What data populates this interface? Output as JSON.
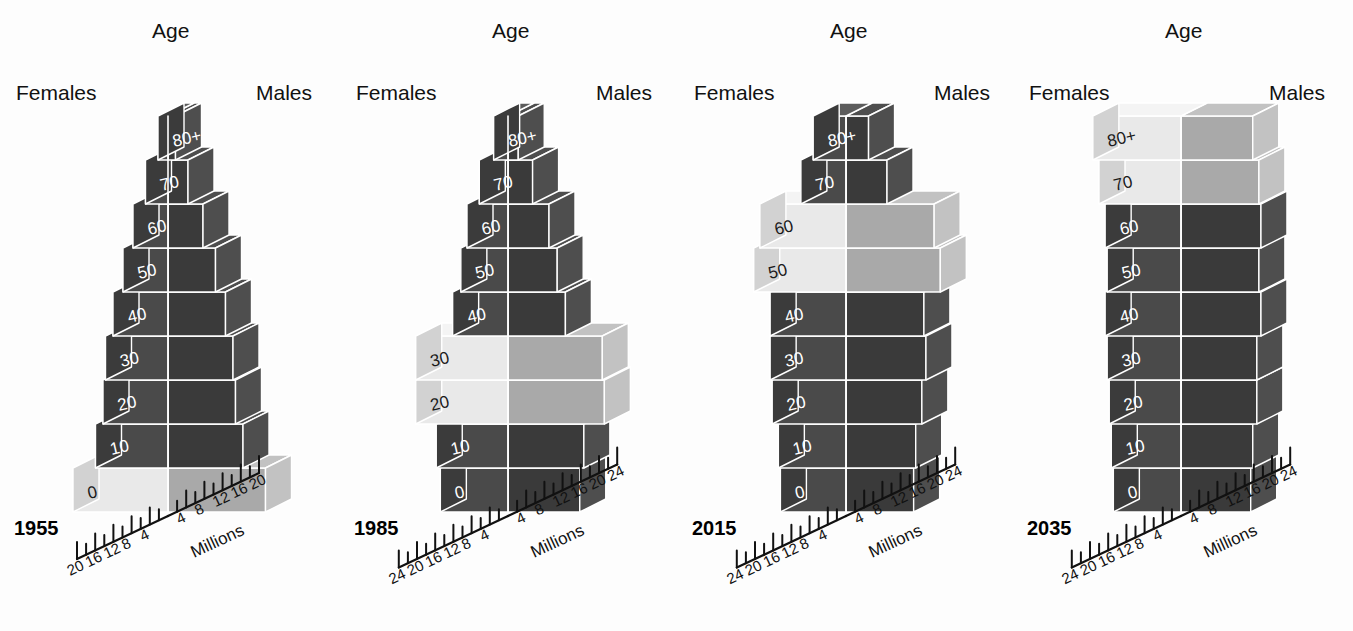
{
  "figure": {
    "background": "#fdfdfd",
    "panel_count": 4
  },
  "labels": {
    "age": "Age",
    "females": "Females",
    "males": "Males",
    "axis_title": "Millions"
  },
  "colors": {
    "dark_front": "#4a4a4a",
    "dark_top": "#5c5c5c",
    "dark_side": "#3b3b3b",
    "dark_male_front": "#3a3a3a",
    "dark_male_top": "#4e4e4e",
    "light_front": "#e9e9e9",
    "light_top": "#f4f4f4",
    "light_side": "#d2d2d2",
    "light_male_front": "#a9a9a9",
    "light_male_top": "#c2c2c2",
    "edge": "#ffffff",
    "text_on_dark": "#ffffff",
    "text_on_light": "#1b1b1b",
    "axis": "#111111"
  },
  "chart_data": {
    "type": "bar",
    "title": "",
    "subtitle": "",
    "xlabel": "Millions",
    "ylabel": "Age",
    "grid": false,
    "legend_position": "top",
    "age_groups": [
      "0",
      "10",
      "20",
      "30",
      "40",
      "50",
      "60",
      "70",
      "80+"
    ],
    "panels": [
      {
        "year": "1955",
        "xlim": [
          0,
          20
        ],
        "ticks_major": [
          20,
          16,
          12,
          8,
          4,
          4,
          8,
          12,
          16,
          20
        ],
        "tick_labels_left": [
          "20",
          "16",
          "12",
          "8",
          "4"
        ],
        "tick_labels_right": [
          "4",
          "8",
          "12",
          "16",
          "20"
        ],
        "tick_step_minor": 2,
        "series": [
          {
            "name": "Females",
            "values": [
              19.0,
              14.5,
              13.0,
              12.5,
              11.0,
              9.0,
              7.0,
              4.5,
              2.0
            ]
          },
          {
            "name": "Males",
            "values": [
              19.5,
              15.0,
              13.5,
              13.0,
              11.5,
              9.5,
              7.0,
              4.0,
              1.5
            ]
          }
        ],
        "highlighted": [
          "0"
        ]
      },
      {
        "year": "1985",
        "xlim": [
          0,
          24
        ],
        "ticks_major": [
          24,
          20,
          16,
          12,
          8,
          4,
          4,
          8,
          12,
          16,
          20,
          24
        ],
        "tick_labels_left": [
          "24",
          "20",
          "16",
          "12",
          "8",
          "4"
        ],
        "tick_labels_right": [
          "4",
          "8",
          "12",
          "16",
          "20",
          "24"
        ],
        "tick_step_minor": 2,
        "series": [
          {
            "name": "Females",
            "values": [
              16.5,
              17.5,
              22.5,
              22.5,
              13.5,
              11.5,
              10.0,
              7.0,
              3.5
            ]
          },
          {
            "name": "Males",
            "values": [
              17.5,
              18.5,
              23.5,
              23.0,
              14.0,
              12.0,
              10.0,
              6.0,
              2.5
            ]
          }
        ],
        "highlighted": [
          "20",
          "30"
        ]
      },
      {
        "year": "2015",
        "xlim": [
          0,
          24
        ],
        "ticks_major": [
          24,
          20,
          16,
          12,
          8,
          4,
          4,
          8,
          12,
          16,
          20,
          24
        ],
        "tick_labels_left": [
          "24",
          "20",
          "16",
          "12",
          "8",
          "4"
        ],
        "tick_labels_right": [
          "4",
          "8",
          "12",
          "16",
          "20",
          "24"
        ],
        "tick_step_minor": 2,
        "series": [
          {
            "name": "Females",
            "values": [
              16.0,
              16.5,
              18.0,
              18.5,
              18.5,
              22.5,
              21.0,
              11.0,
              8.0
            ]
          },
          {
            "name": "Males",
            "values": [
              16.5,
              17.0,
              18.5,
              19.5,
              19.0,
              23.0,
              21.5,
              10.0,
              5.5
            ]
          }
        ],
        "highlighted": [
          "50",
          "60"
        ]
      },
      {
        "year": "2035",
        "xlim": [
          0,
          24
        ],
        "ticks_major": [
          24,
          20,
          16,
          12,
          8,
          4,
          4,
          8,
          12,
          16,
          20,
          24
        ],
        "tick_labels_left": [
          "24",
          "20",
          "16",
          "12",
          "8",
          "4"
        ],
        "tick_labels_right": [
          "4",
          "8",
          "12",
          "16",
          "20",
          "24"
        ],
        "tick_step_minor": 2,
        "series": [
          {
            "name": "Females",
            "values": [
              16.5,
              17.0,
              17.5,
              18.0,
              18.5,
              18.0,
              18.5,
              20.0,
              21.5
            ]
          },
          {
            "name": "Males",
            "values": [
              17.0,
              17.5,
              18.5,
              18.5,
              19.5,
              19.0,
              19.5,
              19.0,
              17.5
            ]
          }
        ],
        "highlighted": [
          "70",
          "80+"
        ]
      }
    ]
  }
}
